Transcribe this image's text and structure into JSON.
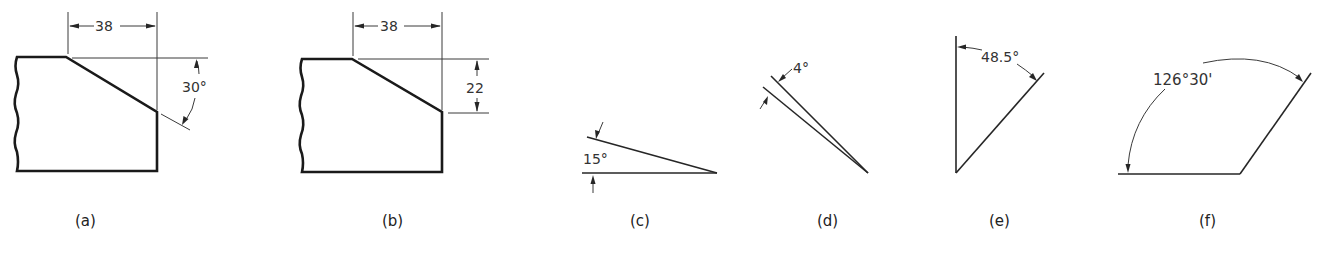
{
  "figure": {
    "panels": [
      {
        "id": "a",
        "caption": "(a)",
        "dims": {
          "horizontal": "38",
          "angle": "30°"
        }
      },
      {
        "id": "b",
        "caption": "(b)",
        "dims": {
          "horizontal": "38",
          "vertical": "22"
        }
      },
      {
        "id": "c",
        "caption": "(c)",
        "dims": {
          "angle": "15°"
        }
      },
      {
        "id": "d",
        "caption": "(d)",
        "dims": {
          "angle": "4°"
        }
      },
      {
        "id": "e",
        "caption": "(e)",
        "dims": {
          "angle": "48.5°"
        }
      },
      {
        "id": "f",
        "caption": "(f)",
        "dims": {
          "angle": "126°30'"
        }
      }
    ]
  }
}
